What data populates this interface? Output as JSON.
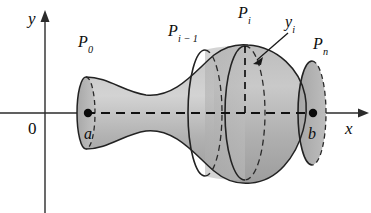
{
  "figure": {
    "kind": "solid-of-revolution-surface-area-diagram",
    "colors": {
      "surface_fill": "#b5b5b5",
      "surface_fill_light": "#cfcfcf",
      "surface_fill_dark": "#a2a2a2",
      "outline": "#1a1a1a",
      "axis": "#2b2b2b",
      "background": "#ffffff"
    }
  },
  "axes": {
    "x_label": "x",
    "y_label": "y",
    "origin_label": "0",
    "x_axis_y": 113,
    "y_axis_x": 45
  },
  "points": [
    {
      "id": "a",
      "label": "a",
      "x": 88,
      "y": 113,
      "dot": true
    },
    {
      "id": "b",
      "label": "b",
      "x": 313,
      "y": 113,
      "dot": true
    }
  ],
  "labels": [
    {
      "id": "P0",
      "base": "P",
      "sub": "0",
      "x": 78,
      "y": 34
    },
    {
      "id": "Pi-1",
      "base": "P",
      "sub": "i − 1",
      "x": 168,
      "y": 23
    },
    {
      "id": "Pi",
      "base": "P",
      "sub": "i",
      "x": 238,
      "y": 5
    },
    {
      "id": "Pn",
      "base": "P",
      "sub": "n",
      "x": 313,
      "y": 36
    },
    {
      "id": "yi",
      "base": "y",
      "sub": "i",
      "x": 285,
      "y": 14
    }
  ],
  "annotations": {
    "yi_pointer": {
      "name": "y-sub-i-arrow",
      "from_x": 288,
      "from_y": 33,
      "to_x": 254,
      "to_y": 63
    },
    "yi_radius": {
      "name": "y-sub-i-dashed-radius",
      "x": 245,
      "top_y": 46,
      "bottom_y": 113,
      "style": "dashed"
    }
  },
  "rings": [
    {
      "id": "P0-cap",
      "cx": 86,
      "cy": 113,
      "rx": 9,
      "ry": 36
    },
    {
      "id": "Pi-1-ring",
      "cx": 205,
      "cy": 113,
      "rx": 17,
      "ry": 63
    },
    {
      "id": "Pi-ring",
      "cx": 245,
      "cy": 113,
      "rx": 20,
      "ry": 67
    },
    {
      "id": "Pn-cap",
      "cx": 312,
      "cy": 113,
      "rx": 14,
      "ry": 52
    }
  ]
}
